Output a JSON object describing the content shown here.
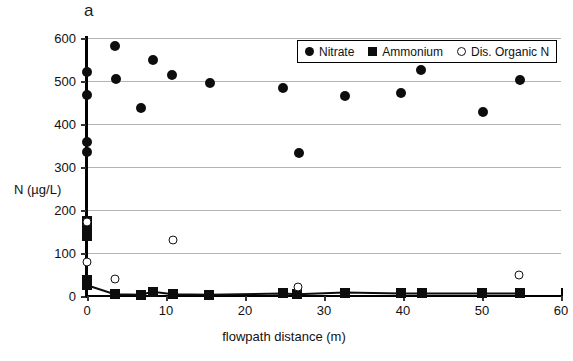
{
  "figure": {
    "panel_label": "a"
  },
  "legend": {
    "entries": [
      {
        "label": "Nitrate",
        "marker": "filled-circle-icon",
        "color": "#0d0d0d"
      },
      {
        "label": "Ammonium",
        "marker": "filled-square-icon",
        "color": "#0d0d0d"
      },
      {
        "label": "Dis. Organic N",
        "marker": "open-circle-icon",
        "color": "#111111"
      }
    ]
  },
  "chart_data": {
    "type": "scatter",
    "title": "a",
    "xlabel": "flowpath distance (m)",
    "ylabel": "N (µg/L)",
    "xlim": [
      0,
      60
    ],
    "ylim": [
      0,
      600
    ],
    "xticks": [
      0,
      10,
      20,
      30,
      40,
      50,
      60
    ],
    "yticks": [
      0,
      100,
      200,
      300,
      400,
      500,
      600
    ],
    "xtick_labels": [
      "0",
      "10",
      "20",
      "30",
      "40",
      "50",
      "60"
    ],
    "ytick_labels": [
      "0",
      "100",
      "200",
      "300",
      "400",
      "500",
      "600"
    ],
    "grid": "horizontal",
    "legend_position": "top-right",
    "series": [
      {
        "name": "Nitrate",
        "marker": "filled-circle",
        "color": "#0d0d0d",
        "points": [
          [
            0.0,
            520
          ],
          [
            0.0,
            467
          ],
          [
            0.0,
            357
          ],
          [
            0.0,
            335
          ],
          [
            3.6,
            581
          ],
          [
            3.7,
            505
          ],
          [
            6.8,
            437
          ],
          [
            8.3,
            548
          ],
          [
            10.8,
            514
          ],
          [
            15.6,
            496
          ],
          [
            24.8,
            484
          ],
          [
            26.8,
            333
          ],
          [
            32.6,
            466
          ],
          [
            39.8,
            472
          ],
          [
            42.3,
            525
          ],
          [
            50.1,
            429
          ],
          [
            54.8,
            502
          ]
        ]
      },
      {
        "name": "Ammonium",
        "marker": "filled-square",
        "color": "#0d0d0d",
        "points": [
          [
            0.0,
            175
          ],
          [
            0.0,
            158
          ],
          [
            0.0,
            140
          ],
          [
            0.0,
            38
          ],
          [
            0.0,
            25
          ],
          [
            3.5,
            4
          ],
          [
            6.8,
            3
          ],
          [
            8.3,
            10
          ],
          [
            10.9,
            4
          ],
          [
            15.5,
            3
          ],
          [
            24.8,
            6
          ],
          [
            26.6,
            4
          ],
          [
            32.6,
            8
          ],
          [
            39.8,
            6
          ],
          [
            42.4,
            6
          ],
          [
            50.0,
            6
          ],
          [
            54.8,
            6
          ]
        ]
      },
      {
        "name": "Dis. Organic N",
        "marker": "open-circle",
        "color": "#111111",
        "points": [
          [
            0.0,
            172
          ],
          [
            0.0,
            80
          ],
          [
            3.5,
            40
          ],
          [
            10.9,
            130
          ],
          [
            26.7,
            22
          ],
          [
            54.7,
            50
          ]
        ]
      }
    ]
  }
}
